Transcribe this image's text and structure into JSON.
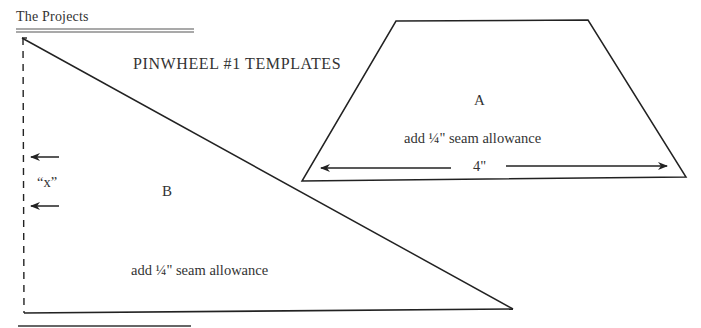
{
  "header": {
    "section_title": "The Projects"
  },
  "page": {
    "title": "PINWHEEL #1 TEMPLATES"
  },
  "template_a": {
    "label": "A",
    "note": "add ¼\" seam allowance",
    "dimension": "4\""
  },
  "template_b": {
    "label": "B",
    "note": "add ¼\" seam allowance",
    "marker": "“x”"
  },
  "colors": {
    "ink": "#2a2a2a",
    "background": "#ffffff"
  }
}
